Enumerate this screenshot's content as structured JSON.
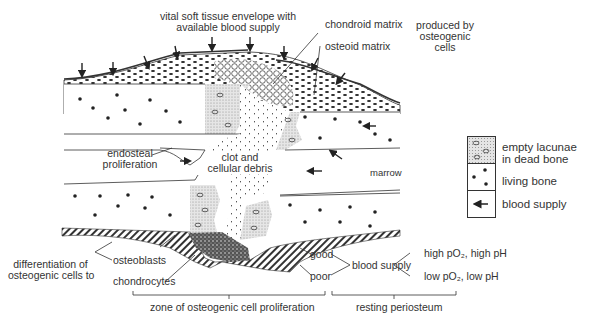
{
  "figure": {
    "labels": {
      "soft_tissue": "vital soft tissue envelope with\navailable blood supply",
      "soft_tissue_line1": "vital soft tissue envelope with",
      "soft_tissue_line2": "available blood supply",
      "chondroid": "chondroid matrix",
      "osteoid": "osteoid matrix",
      "produced_line1": "produced by",
      "produced_line2": "osteogenic",
      "produced_line3": "cells",
      "endosteal_line1": "endosteal",
      "endosteal_line2": "proliferation",
      "clot_line1": "clot and",
      "clot_line2": "cellular debris",
      "marrow": "marrow",
      "differentiation_line1": "differentiation of",
      "differentiation_line2": "osteogenic cells to",
      "osteoblasts": "osteoblasts",
      "chondrocytes": "chondrocytes",
      "good": "good",
      "poor": "poor",
      "blood_supply": "blood supply",
      "high": "high pO₂, high pH",
      "low": "low pO₂, low pH",
      "zone": "zone of osteogenic cell proliferation",
      "resting": "resting periosteum"
    },
    "legend": [
      {
        "key": "dead-bone",
        "label_line1": "empty lacunae",
        "label_line2": "in dead bone"
      },
      {
        "key": "living-bone",
        "label_line1": "living bone"
      },
      {
        "key": "blood-supply",
        "label_line1": "blood supply"
      }
    ]
  }
}
